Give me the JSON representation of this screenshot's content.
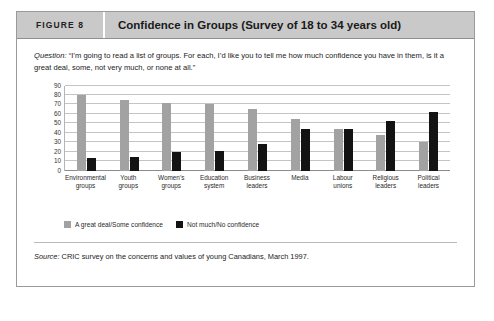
{
  "figure": {
    "tag": "FIGURE 8",
    "title": "Confidence in Groups (Survey of 18 to 34 years old)",
    "question_label": "Question:",
    "question_text": " “I’m going to read a list of groups. For each, I’d like you to tell me how much confidence you have in them, is it a great deal, some, not very much, or none at all.”",
    "source_label": "Source:",
    "source_text": " CRIC survey on the concerns and values of young Canadians, March 1997."
  },
  "colors": {
    "series_0": "#a2a2a2",
    "series_1": "#131313",
    "header_bg": "#c9c9c9",
    "frame_border": "#9a9a9a",
    "gridline": "#c4c4c4"
  },
  "chart_data": {
    "type": "bar",
    "title": "Confidence in Groups (Survey of 18 to 34 years old)",
    "xlabel": "",
    "ylabel": "",
    "ylim": [
      0,
      90
    ],
    "yticks": [
      0,
      10,
      20,
      30,
      40,
      50,
      60,
      70,
      80,
      90
    ],
    "grid": true,
    "legend_position": "bottom-left",
    "categories": [
      "Environmental groups",
      "Youth groups",
      "Women’s groups",
      "Education system",
      "Business leaders",
      "Media",
      "Labour unions",
      "Religious leaders",
      "Political leaders"
    ],
    "series": [
      {
        "name": "A great deal/Some confidence",
        "values": [
          80,
          75,
          72,
          70,
          65,
          55,
          44,
          38,
          30
        ]
      },
      {
        "name": "Not much/No confidence",
        "values": [
          13,
          14,
          20,
          21,
          28,
          44,
          44,
          52,
          62
        ]
      }
    ]
  }
}
